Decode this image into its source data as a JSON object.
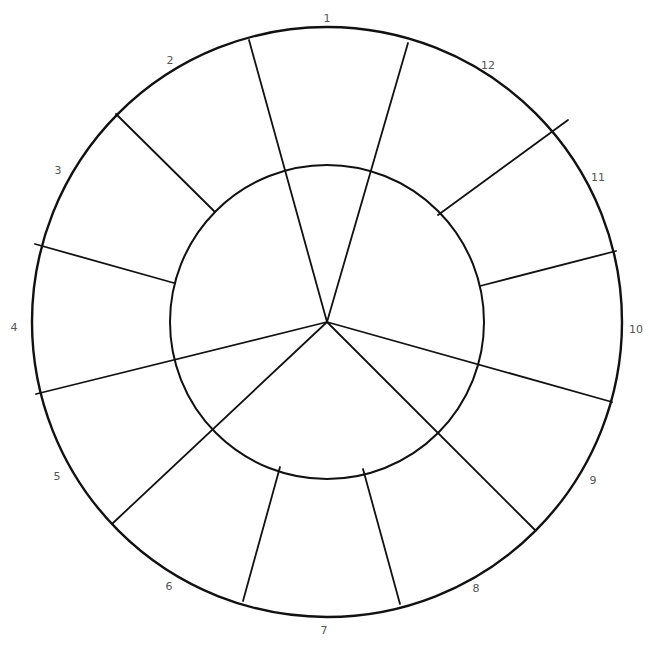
{
  "diagram": {
    "type": "color-wheel-template",
    "center": [
      327,
      322
    ],
    "outer_radius": 295,
    "inner_radius": 157,
    "stroke_color": "#111111",
    "label_color": "#555555",
    "segments": [
      {
        "label": "1",
        "pos": [
          327,
          18
        ]
      },
      {
        "label": "2",
        "pos": [
          170,
          60
        ]
      },
      {
        "label": "3",
        "pos": [
          58,
          170
        ]
      },
      {
        "label": "4",
        "pos": [
          14,
          327
        ]
      },
      {
        "label": "5",
        "pos": [
          57,
          476
        ]
      },
      {
        "label": "6",
        "pos": [
          169,
          586
        ]
      },
      {
        "label": "7",
        "pos": [
          324,
          630
        ]
      },
      {
        "label": "8",
        "pos": [
          476,
          588
        ]
      },
      {
        "label": "9",
        "pos": [
          593,
          480
        ]
      },
      {
        "label": "10",
        "pos": [
          636,
          329
        ]
      },
      {
        "label": "11",
        "pos": [
          598,
          177
        ]
      },
      {
        "label": "12",
        "pos": [
          488,
          65
        ]
      }
    ],
    "outer_dividers": [
      {
        "name": "divider-2-3",
        "from": [
          215,
          212
        ],
        "to": [
          116,
          114
        ]
      },
      {
        "name": "divider-3-4",
        "from": [
          174,
          283
        ],
        "to": [
          35,
          244
        ]
      },
      {
        "name": "divider-6-7",
        "from": [
          280,
          467
        ],
        "to": [
          243,
          601
        ]
      },
      {
        "name": "divider-7-8",
        "from": [
          363,
          469
        ],
        "to": [
          400,
          604
        ]
      },
      {
        "name": "divider-10-11",
        "from": [
          480,
          286
        ],
        "to": [
          616,
          251
        ]
      },
      {
        "name": "divider-11-12",
        "from": [
          438,
          215
        ],
        "to": [
          568,
          120
        ]
      }
    ],
    "center_dividers": [
      {
        "name": "divider-1-2",
        "to": [
          249,
          40
        ]
      },
      {
        "name": "divider-12-1",
        "to": [
          408,
          43
        ]
      },
      {
        "name": "divider-4-5",
        "to": [
          36,
          394
        ]
      },
      {
        "name": "divider-5-6",
        "to": [
          113,
          523
        ]
      },
      {
        "name": "divider-8-9",
        "to": [
          535,
          530
        ]
      },
      {
        "name": "divider-9-10",
        "to": [
          612,
          402
        ]
      }
    ]
  }
}
